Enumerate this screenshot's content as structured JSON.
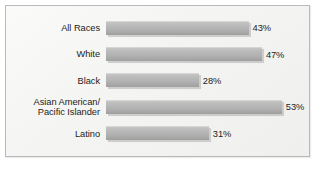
{
  "chart_data": {
    "type": "bar",
    "orientation": "horizontal",
    "title": "",
    "xlabel": "",
    "ylabel": "",
    "grid": false,
    "legend": false,
    "xlim": [
      0,
      60
    ],
    "value_suffix": "%",
    "categories": [
      "All Races",
      "White",
      "Black",
      "Asian American/\nPacific Islander",
      "Latino"
    ],
    "values": [
      43,
      47,
      28,
      53,
      31
    ],
    "value_labels": [
      "43%",
      "47%",
      "28%",
      "53%",
      "31%"
    ],
    "bars": [
      {
        "label": "All Races",
        "value": 43,
        "value_label": "43%"
      },
      {
        "label": "White",
        "value": 47,
        "value_label": "47%"
      },
      {
        "label": "Black",
        "value": 28,
        "value_label": "28%"
      },
      {
        "label": "Asian American/\nPacific Islander",
        "value": 53,
        "value_label": "53%"
      },
      {
        "label": "Latino",
        "value": 31,
        "value_label": "31%"
      }
    ]
  },
  "style": {
    "bar_color": "#b2b2b2",
    "bar_highlight": "#c6c6c6",
    "bar_shadow": "#9e9e9e",
    "text_color": "#1c1c1c",
    "panel_background": "#f6f6f4",
    "border_color": "#b9b9b7",
    "page_background": "#ffffff"
  }
}
